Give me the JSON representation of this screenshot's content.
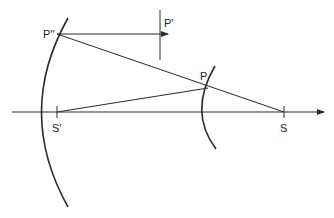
{
  "diagram": {
    "type": "optics-ray-diagram",
    "labels": {
      "p_double_prime": "P''",
      "p_prime": "P'",
      "p": "P",
      "s_prime": "S'",
      "s": "S"
    },
    "colors": {
      "line": "#2a2a2a",
      "background": "#ffffff"
    }
  }
}
